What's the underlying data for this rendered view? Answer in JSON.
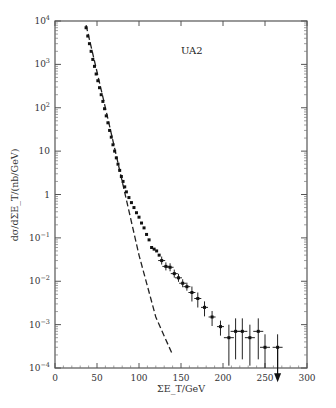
{
  "chart_data": {
    "type": "scatter",
    "title": "",
    "annotation": "UA2",
    "xlabel": "ΣE_T/GeV",
    "ylabel": "dσ/dΣE_T/(nb/GeV)",
    "xlim": [
      0,
      300
    ],
    "ylim": [
      0.0001,
      10000
    ],
    "yscale": "log",
    "grid": false,
    "legend": null,
    "x_ticks": [
      "0",
      "50",
      "100",
      "150",
      "200",
      "250",
      "300"
    ],
    "y_ticks": [
      "10^-4",
      "10^-3",
      "10^-2",
      "10^-1",
      "1",
      "10",
      "10^2",
      "10^3",
      "10^4"
    ],
    "series": [
      {
        "name": "UA2 data",
        "style": "points with error bars",
        "points": [
          {
            "x": 37,
            "y": 7000
          },
          {
            "x": 39,
            "y": 4500
          },
          {
            "x": 41,
            "y": 3000
          },
          {
            "x": 43,
            "y": 2000
          },
          {
            "x": 45,
            "y": 1300
          },
          {
            "x": 47,
            "y": 900
          },
          {
            "x": 49,
            "y": 600
          },
          {
            "x": 51,
            "y": 420
          },
          {
            "x": 53,
            "y": 290
          },
          {
            "x": 55,
            "y": 200
          },
          {
            "x": 57,
            "y": 140
          },
          {
            "x": 59,
            "y": 95
          },
          {
            "x": 61,
            "y": 65
          },
          {
            "x": 63,
            "y": 45
          },
          {
            "x": 65,
            "y": 30
          },
          {
            "x": 67,
            "y": 21
          },
          {
            "x": 69,
            "y": 14
          },
          {
            "x": 71,
            "y": 10
          },
          {
            "x": 73,
            "y": 7
          },
          {
            "x": 75,
            "y": 5
          },
          {
            "x": 77,
            "y": 3.6
          },
          {
            "x": 79,
            "y": 2.6
          },
          {
            "x": 81,
            "y": 2
          },
          {
            "x": 83,
            "y": 1.5
          },
          {
            "x": 85,
            "y": 1.15
          },
          {
            "x": 88,
            "y": 0.85
          },
          {
            "x": 91,
            "y": 0.65
          },
          {
            "x": 94,
            "y": 0.5
          },
          {
            "x": 97,
            "y": 0.38
          },
          {
            "x": 100,
            "y": 0.3
          },
          {
            "x": 103,
            "y": 0.22
          },
          {
            "x": 106,
            "y": 0.17
          },
          {
            "x": 109,
            "y": 0.12
          },
          {
            "x": 112,
            "y": 0.09
          },
          {
            "x": 115,
            "y": 0.06
          },
          {
            "x": 118,
            "y": 0.055
          },
          {
            "x": 121,
            "y": 0.05
          },
          {
            "x": 124,
            "y": 0.04
          },
          {
            "x": 127,
            "y": 0.03
          },
          {
            "x": 132,
            "y": 0.022
          },
          {
            "x": 137,
            "y": 0.021
          },
          {
            "x": 142,
            "y": 0.015
          },
          {
            "x": 147,
            "y": 0.012
          },
          {
            "x": 152,
            "y": 0.009
          },
          {
            "x": 157,
            "y": 0.0075
          },
          {
            "x": 163,
            "y": 0.0055
          },
          {
            "x": 170,
            "y": 0.004
          },
          {
            "x": 178,
            "y": 0.0025
          },
          {
            "x": 187,
            "y": 0.0015
          },
          {
            "x": 197,
            "y": 0.0009
          },
          {
            "x": 207,
            "y": 0.0005
          },
          {
            "x": 215,
            "y": 0.0007
          },
          {
            "x": 223,
            "y": 0.0007
          },
          {
            "x": 232,
            "y": 0.0005
          },
          {
            "x": 242,
            "y": 0.0007
          },
          {
            "x": 250,
            "y": 0.0003
          },
          {
            "x": 265,
            "y": 0.0003,
            "upper_limit": true
          }
        ]
      },
      {
        "name": "QCD extrapolation",
        "style": "dashed line",
        "points": [
          {
            "x": 37,
            "y": 8000
          },
          {
            "x": 60,
            "y": 100
          },
          {
            "x": 80,
            "y": 2
          },
          {
            "x": 100,
            "y": 0.04
          },
          {
            "x": 120,
            "y": 0.0015
          },
          {
            "x": 140,
            "y": 0.0002
          }
        ]
      }
    ]
  }
}
